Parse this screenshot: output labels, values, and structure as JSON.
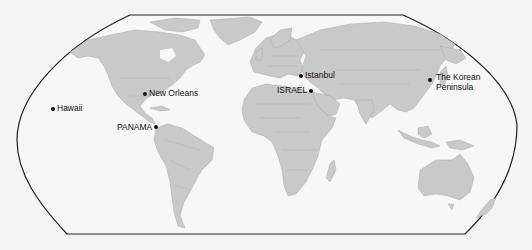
{
  "map": {
    "projection": "Robinson-style world map",
    "colors": {
      "ocean": "#f7f7f7",
      "land": "#c9c9c9",
      "border": "#9a9a9a",
      "frame": "#222222",
      "marker": "#111111"
    },
    "locations": [
      {
        "id": "hawaii",
        "label": "Hawaii",
        "x": 53,
        "y": 109,
        "label_side": "right"
      },
      {
        "id": "new-orleans",
        "label": "New Orleans",
        "x": 145,
        "y": 94,
        "label_side": "right"
      },
      {
        "id": "panama",
        "label": "PANAMA",
        "x": 156,
        "y": 127,
        "label_side": "left"
      },
      {
        "id": "istanbul",
        "label": "Istanbul",
        "x": 301,
        "y": 76,
        "label_side": "right"
      },
      {
        "id": "israel",
        "label": "ISRAEL",
        "x": 311,
        "y": 91,
        "label_side": "left"
      },
      {
        "id": "korean-peninsula",
        "label_line1": "The Korean",
        "label_line2": "Peninsula",
        "x": 430,
        "y": 80,
        "label_side": "right"
      }
    ]
  }
}
